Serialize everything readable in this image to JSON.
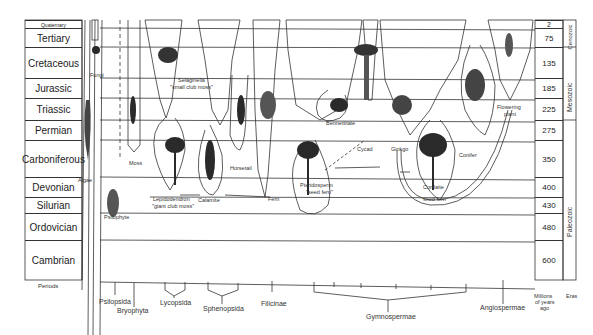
{
  "figure": {
    "periods_label": "Periods",
    "myr_label": [
      "Millions",
      "of years",
      "ago"
    ],
    "eras_label": "Eras",
    "periods": [
      {
        "name": "Quaternary",
        "myr": "2",
        "top": 20,
        "height": 8,
        "small": true
      },
      {
        "name": "Tertiary",
        "myr": "75",
        "top": 28,
        "height": 19
      },
      {
        "name": "Cretaceous",
        "myr": "135",
        "top": 47,
        "height": 31
      },
      {
        "name": "Jurassic",
        "myr": "185",
        "top": 78,
        "height": 20
      },
      {
        "name": "Triassic",
        "myr": "225",
        "top": 98,
        "height": 22
      },
      {
        "name": "Permian",
        "myr": "275",
        "top": 120,
        "height": 20
      },
      {
        "name": "Carboniferous",
        "myr": "350",
        "top": 140,
        "height": 37
      },
      {
        "name": "Devonian",
        "myr": "400",
        "top": 177,
        "height": 20
      },
      {
        "name": "Silurian",
        "myr": "430",
        "top": 197,
        "height": 16
      },
      {
        "name": "Ordovician",
        "myr": "480",
        "top": 213,
        "height": 27
      },
      {
        "name": "Cambrian",
        "myr": "600",
        "top": 240,
        "height": 40
      }
    ],
    "eras": [
      {
        "name": "Cenozoic",
        "top": 20,
        "height": 27
      },
      {
        "name": "Mesozoic",
        "top": 47,
        "height": 73
      },
      {
        "name": "Paleozoic",
        "top": 120,
        "height": 160
      }
    ],
    "plant_labels": {
      "fungi": "Fungi",
      "algae": "Algae",
      "moss": "Moss",
      "psilophyte": "Psilophyte",
      "lepidodendron": "Lepidodendron",
      "lepidodendron_sub": "\"giant club moss\"",
      "selaginella": "Selaginella",
      "selaginella_sub": "\"small club moss\"",
      "calamite": "Calamite",
      "horsetail": "Horsetail",
      "fern": "Fern",
      "pteridosperm": "Pteridosperm",
      "pteridosperm_sub": "\"seed fern\"",
      "bennettitale": "Bennettitale",
      "cycad": "Cycad",
      "ginkgo": "Ginkgo",
      "cordaite": "Cordaite",
      "seed_fern": "seed fern",
      "conifer": "Conifer",
      "flowering": "Flowering",
      "flowering_sub": "plant"
    },
    "groups": {
      "psilopsida": "Psilopsida",
      "bryophyta": "Bryophyta",
      "lycopsida": "Lycopsida",
      "sphenopsida": "Sphenopsida",
      "filicinae": "Filicinae",
      "gymnospermae": "Gymnospermae",
      "angiospermae": "Angiospermae"
    }
  }
}
